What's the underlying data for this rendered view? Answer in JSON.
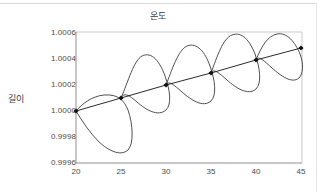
{
  "chart_data": {
    "type": "line",
    "title": "온도",
    "xlabel": "",
    "ylabel": "길이",
    "xlim": [
      20,
      45
    ],
    "ylim": [
      0.9996,
      1.0006
    ],
    "grid": false,
    "legend": "none",
    "xticks": [
      "20",
      "25",
      "30",
      "35",
      "40",
      "45"
    ],
    "xtick_values": [
      20,
      25,
      30,
      35,
      40,
      45
    ],
    "yticks": [
      "0.9996",
      "0.9998",
      "1.0000",
      "1.0002",
      "1.0004",
      "1.0006"
    ],
    "ytick_values": [
      0.9996,
      0.9998,
      1.0,
      1.0002,
      1.0004,
      1.0006
    ],
    "series": [
      {
        "name": "mean-trend",
        "marker": "filled-diamond",
        "color": "#1a1a1a",
        "x": [
          20,
          25,
          30,
          35,
          40,
          45
        ],
        "values": [
          1.0,
          1.0001,
          1.0002,
          1.0003,
          1.0004,
          1.0005
        ]
      },
      {
        "name": "hysteresis-loop",
        "marker": "none",
        "color": "#3c3c3c",
        "x": [
          20,
          22,
          23.5,
          25,
          26.5,
          27.5,
          28.5,
          30,
          31.5,
          32.5,
          33.5,
          35,
          36.5,
          37.5,
          38.5,
          40,
          41.5,
          42.5,
          43.5,
          45
        ],
        "values": [
          1.0,
          1.00012,
          1.00011,
          1.0001,
          0.99978,
          0.99967,
          0.99985,
          1.0002,
          1.00031,
          1.00029,
          1.00018,
          1.0003,
          1.00015,
          1.00012,
          1.00024,
          1.0004,
          1.00052,
          1.0005,
          1.00038,
          1.0005
        ]
      }
    ],
    "path_commands": {
      "trend": "M 76,111 L 121,98 L 166,85 L 211,73 L 256,60 L 301,48",
      "loop_lower": "M 76,111 C 82,104 92,96 104,95 C 118,94 124,100 128,110 C 133,124 134,144 128,150 C 120,157 108,150 99,142 C 90,133 82,121 76,111 Z",
      "loop_mid1": "M 121,98 C 128,82 134,60 142,56 C 152,51 160,62 165,76 C 170,90 172,104 166,110 C 158,117 146,110 137,102 C 129,95 124,92 121,98 Z",
      "loop_mid2": "M 166,85 C 172,70 178,50 187,46 C 197,42 205,52 210,66 C 215,80 217,95 211,101 C 203,108 191,100 182,92 C 174,85 169,80 166,85 Z",
      "loop_upper1": "M 211,73 C 217,57 223,38 232,35 C 242,31 250,41 255,54 C 260,68 262,83 256,89 C 248,96 236,88 227,80 C 219,73 214,68 211,73 Z",
      "loop_upper2": "M 256,60 C 262,45 268,36 277,34 C 287,32 295,42 300,54 C 304,64 303,74 299,78 C 292,84 281,76 272,68 C 264,61 259,55 256,60 Z"
    },
    "marker_pixels": [
      {
        "x": 76,
        "y": 111
      },
      {
        "x": 121,
        "y": 98
      },
      {
        "x": 166,
        "y": 85
      },
      {
        "x": 211,
        "y": 73
      },
      {
        "x": 256,
        "y": 60
      },
      {
        "x": 301,
        "y": 48
      }
    ],
    "plot_box": {
      "left": 76,
      "top": 32,
      "right": 302,
      "bottom": 163
    },
    "colors": {
      "axis": "#9b9b9b",
      "line": "#2b2b2b",
      "curve": "#3c3c3c",
      "marker": "#111111",
      "text": "#3a3a3a",
      "background": "#ffffff"
    }
  }
}
